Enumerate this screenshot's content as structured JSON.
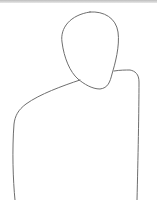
{
  "canvas": {
    "width": 157,
    "height": 200,
    "background": "#ffffff",
    "stroke_color": "#6e6e6e",
    "subject": "line sketch of a person outline (head and torso)"
  }
}
